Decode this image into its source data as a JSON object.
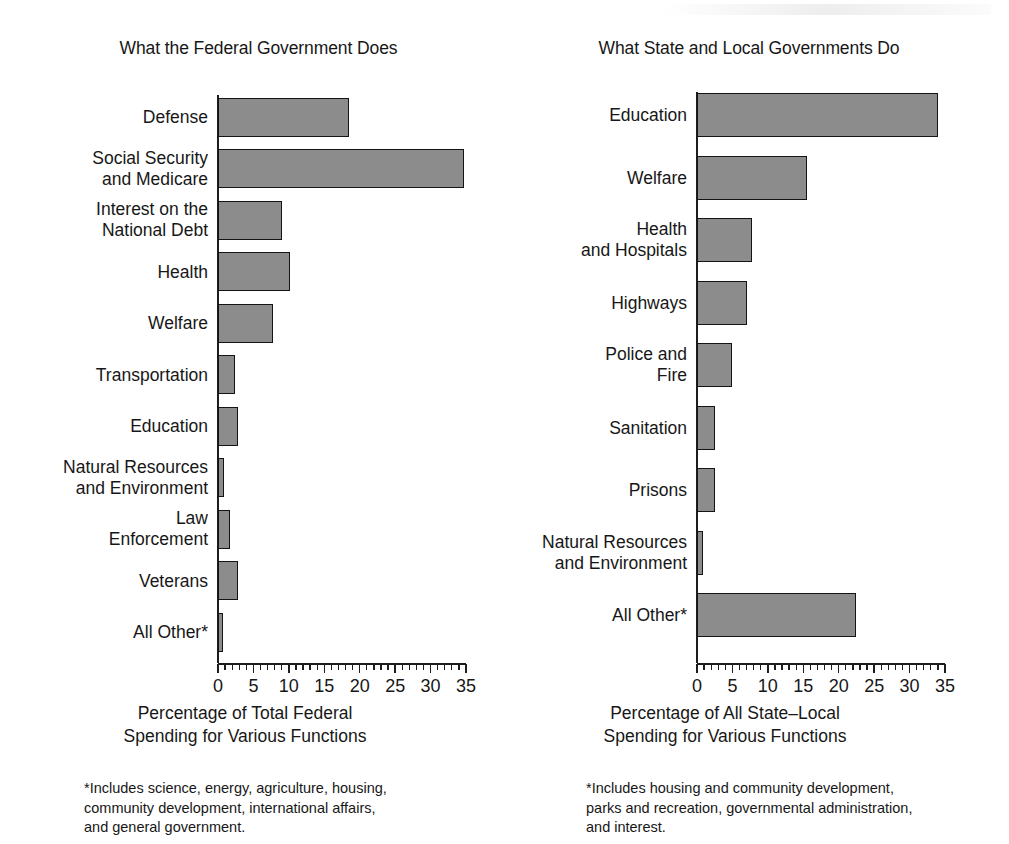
{
  "chart_data": [
    {
      "type": "bar",
      "orientation": "horizontal",
      "title": "What the Federal Government Does",
      "xlabel": "Percentage of Total Federal\nSpending for Various Functions",
      "ylabel": "",
      "xlim": [
        0,
        35
      ],
      "xticks": [
        0,
        5,
        10,
        15,
        20,
        25,
        30,
        35
      ],
      "xtick_labels": [
        "0",
        "5",
        "10",
        "15",
        "20",
        "25",
        "30",
        "35"
      ],
      "minor_tick_step": 1,
      "grid": false,
      "legend": "none",
      "bar_color": "#8c8c8c",
      "bar_edge_color": "#141414",
      "footnote": "*Includes science, energy, agriculture, housing,\ncommunity development, international affairs,\nand general government.",
      "categories": [
        "Defense",
        "Social Security\nand Medicare",
        "Interest on the\nNational Debt",
        "Health",
        "Welfare",
        "Transportation",
        "Education",
        "Natural Resources\nand Environment",
        "Law\nEnforcement",
        "Veterans",
        "All Other*"
      ],
      "values": [
        18.5,
        34.7,
        9.0,
        10.2,
        7.8,
        2.4,
        2.8,
        0.9,
        1.7,
        2.8,
        0.7
      ]
    },
    {
      "type": "bar",
      "orientation": "horizontal",
      "title": "What State and Local Governments Do",
      "xlabel": "Percentage of All State–Local\nSpending for Various Functions",
      "ylabel": "",
      "xlim": [
        0,
        35
      ],
      "xticks": [
        0,
        5,
        10,
        15,
        20,
        25,
        30,
        35
      ],
      "xtick_labels": [
        "0",
        "5",
        "10",
        "15",
        "20",
        "25",
        "30",
        "35"
      ],
      "minor_tick_step": 1,
      "grid": false,
      "legend": "none",
      "bar_color": "#8c8c8c",
      "bar_edge_color": "#141414",
      "footnote": "*Includes housing and community development,\nparks and recreation, governmental administration,\nand  interest.",
      "categories": [
        "Education",
        "Welfare",
        "Health\nand Hospitals",
        "Highways",
        "Police and\nFire",
        "Sanitation",
        "Prisons",
        "Natural Resources\nand Environment",
        "All Other*"
      ],
      "values": [
        34.0,
        15.5,
        7.8,
        7.0,
        5.0,
        2.5,
        2.6,
        0.9,
        22.5
      ]
    }
  ]
}
